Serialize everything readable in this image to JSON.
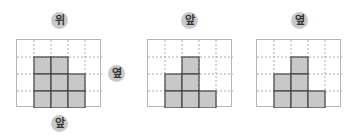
{
  "labels": {
    "top": "위",
    "front": "앞",
    "side": "옆"
  },
  "colors": {
    "filled": "#c8c8c8",
    "filled_border": "#444444",
    "grid_line": "#aaaaaa",
    "badge": "#c9c9c9"
  },
  "views": [
    {
      "name": "top-view",
      "title": "위",
      "cols": 5,
      "rows": 4,
      "filled": [
        [
          1,
          1
        ],
        [
          2,
          1
        ],
        [
          1,
          2
        ],
        [
          2,
          2
        ],
        [
          3,
          2
        ],
        [
          1,
          3
        ],
        [
          2,
          3
        ],
        [
          3,
          3
        ]
      ]
    },
    {
      "name": "front-view",
      "title": "앞",
      "cols": 5,
      "rows": 4,
      "filled": [
        [
          2,
          1
        ],
        [
          1,
          2
        ],
        [
          2,
          2
        ],
        [
          1,
          3
        ],
        [
          2,
          3
        ],
        [
          3,
          3
        ]
      ]
    },
    {
      "name": "side-view",
      "title": "옆",
      "cols": 5,
      "rows": 4,
      "filled": [
        [
          2,
          1
        ],
        [
          1,
          2
        ],
        [
          2,
          2
        ],
        [
          1,
          3
        ],
        [
          2,
          3
        ],
        [
          3,
          3
        ]
      ]
    }
  ]
}
